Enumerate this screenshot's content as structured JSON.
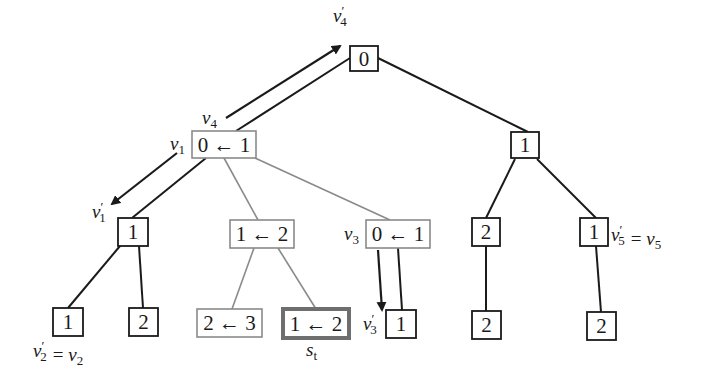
{
  "diagram": {
    "type": "search-tree",
    "colors": {
      "dark": "#1a1a1a",
      "gray": "#8a8a8a",
      "highlight_border": "#6e6e6e"
    },
    "nodes": [
      {
        "id": "root",
        "text": "0",
        "style": "dark",
        "x": 350,
        "y": 46,
        "w": 28,
        "h": 25
      },
      {
        "id": "n_v1",
        "text": "0 ← 1",
        "style": "gray",
        "x": 192,
        "y": 131,
        "w": 64,
        "h": 27
      },
      {
        "id": "n_r1",
        "text": "1",
        "style": "dark",
        "x": 511,
        "y": 132,
        "w": 28,
        "h": 26
      },
      {
        "id": "n_v1p",
        "text": "1",
        "style": "dark",
        "x": 118,
        "y": 218,
        "w": 30,
        "h": 28
      },
      {
        "id": "n_12",
        "text": "1 ← 2",
        "style": "gray",
        "x": 230,
        "y": 220,
        "w": 64,
        "h": 28
      },
      {
        "id": "n_v3",
        "text": "0 ← 1",
        "style": "gray",
        "x": 366,
        "y": 220,
        "w": 64,
        "h": 28
      },
      {
        "id": "n_r2",
        "text": "2",
        "style": "dark",
        "x": 472,
        "y": 218,
        "w": 28,
        "h": 28
      },
      {
        "id": "n_v5",
        "text": "1",
        "style": "dark",
        "x": 580,
        "y": 218,
        "w": 28,
        "h": 28
      },
      {
        "id": "n_v2",
        "text": "1",
        "style": "dark",
        "x": 53,
        "y": 308,
        "w": 30,
        "h": 28
      },
      {
        "id": "n_l2",
        "text": "2",
        "style": "dark",
        "x": 129,
        "y": 308,
        "w": 29,
        "h": 28
      },
      {
        "id": "n_23",
        "text": "2 ← 3",
        "style": "gray",
        "x": 197,
        "y": 309,
        "w": 65,
        "h": 28
      },
      {
        "id": "n_st",
        "text": "1 ← 2",
        "style": "highlight",
        "x": 283,
        "y": 309,
        "w": 66,
        "h": 29
      },
      {
        "id": "n_v3p",
        "text": "1",
        "style": "dark",
        "x": 386,
        "y": 310,
        "w": 30,
        "h": 28
      },
      {
        "id": "n_rl2",
        "text": "2",
        "style": "dark",
        "x": 472,
        "y": 311,
        "w": 29,
        "h": 28
      },
      {
        "id": "n_rr2",
        "text": "2",
        "style": "dark",
        "x": 587,
        "y": 312,
        "w": 29,
        "h": 28
      }
    ],
    "edges": [
      {
        "from": "root",
        "to": "n_v1",
        "style": "dark",
        "x1": 350,
        "y1": 58,
        "x2": 236,
        "y2": 131
      },
      {
        "from": "root",
        "to": "n_r1",
        "style": "dark",
        "x1": 378,
        "y1": 58,
        "x2": 528,
        "y2": 132
      },
      {
        "from": "n_v1",
        "to": "n_v1p",
        "style": "dark",
        "x1": 206,
        "y1": 158,
        "x2": 132,
        "y2": 218
      },
      {
        "from": "n_v1",
        "to": "n_12",
        "style": "gray",
        "x1": 224,
        "y1": 158,
        "x2": 258,
        "y2": 220
      },
      {
        "from": "n_v1",
        "to": "n_v3",
        "style": "gray",
        "x1": 255,
        "y1": 158,
        "x2": 390,
        "y2": 220
      },
      {
        "from": "n_r1",
        "to": "n_r2",
        "style": "dark",
        "x1": 515,
        "y1": 159,
        "x2": 486,
        "y2": 218
      },
      {
        "from": "n_r1",
        "to": "n_v5",
        "style": "dark",
        "x1": 537,
        "y1": 159,
        "x2": 596,
        "y2": 218
      },
      {
        "from": "n_v1p",
        "to": "n_v2",
        "style": "dark",
        "x1": 120,
        "y1": 246,
        "x2": 68,
        "y2": 308
      },
      {
        "from": "n_v1p",
        "to": "n_l2",
        "style": "dark",
        "x1": 139,
        "y1": 246,
        "x2": 143,
        "y2": 308
      },
      {
        "from": "n_12",
        "to": "n_23",
        "style": "gray",
        "x1": 254,
        "y1": 248,
        "x2": 232,
        "y2": 309
      },
      {
        "from": "n_12",
        "to": "n_st",
        "style": "gray",
        "x1": 278,
        "y1": 248,
        "x2": 316,
        "y2": 309
      },
      {
        "from": "n_v3",
        "to": "n_v3p",
        "style": "dark",
        "x1": 398,
        "y1": 248,
        "x2": 402,
        "y2": 310
      },
      {
        "from": "n_r2",
        "to": "n_rl2",
        "style": "dark",
        "x1": 486,
        "y1": 246,
        "x2": 486,
        "y2": 311
      },
      {
        "from": "n_v5",
        "to": "n_rr2",
        "style": "dark",
        "x1": 596,
        "y1": 246,
        "x2": 601,
        "y2": 312
      }
    ],
    "arrows": [
      {
        "name": "arrow-v4-to-v4prime",
        "x1": 226,
        "y1": 118,
        "x2": 340,
        "y2": 46
      },
      {
        "name": "arrow-v1-to-v1prime",
        "x1": 177,
        "y1": 153,
        "x2": 112,
        "y2": 204
      },
      {
        "name": "arrow-v3-to-v3prime",
        "x1": 378,
        "y1": 250,
        "x2": 382,
        "y2": 310
      }
    ],
    "labels": [
      {
        "name": "label-v4-prime",
        "base": "v",
        "sub": "4",
        "prime": true,
        "x": 333,
        "y": 22
      },
      {
        "name": "label-v4",
        "base": "v",
        "sub": "4",
        "prime": false,
        "x": 202,
        "y": 124
      },
      {
        "name": "label-v1",
        "base": "v",
        "sub": "1",
        "prime": false,
        "x": 170,
        "y": 150
      },
      {
        "name": "label-v1-prime",
        "base": "v",
        "sub": "1",
        "prime": true,
        "x": 92,
        "y": 218
      },
      {
        "name": "label-v3",
        "base": "v",
        "sub": "3",
        "prime": false,
        "x": 344,
        "y": 240
      },
      {
        "name": "label-v3-prime",
        "base": "v",
        "sub": "3",
        "prime": true,
        "x": 363,
        "y": 330
      },
      {
        "name": "label-v2-prime-eq",
        "base": "v",
        "sub": "2",
        "prime": true,
        "x": 33,
        "y": 357,
        "suffix": "= v",
        "suffix_sub": "2"
      },
      {
        "name": "label-v5-prime-eq",
        "base": "v",
        "sub": "5",
        "prime": true,
        "x": 611,
        "y": 241,
        "suffix": "= v",
        "suffix_sub": "5"
      },
      {
        "name": "label-st",
        "base": "s",
        "sub": "t",
        "prime": false,
        "x": 306,
        "y": 356
      }
    ]
  }
}
